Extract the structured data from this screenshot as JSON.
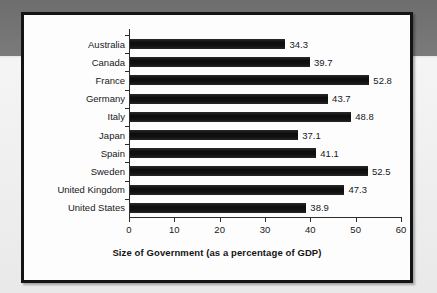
{
  "chart_data": {
    "type": "bar",
    "orientation": "horizontal",
    "title": "",
    "xlabel": "Size of Government (as a percentage of GDP)",
    "ylabel": "",
    "categories": [
      "Australia",
      "Canada",
      "France",
      "Germany",
      "Italy",
      "Japan",
      "Spain",
      "Sweden",
      "United Kingdom",
      "United States"
    ],
    "values": [
      34.3,
      39.7,
      52.8,
      43.7,
      48.8,
      37.1,
      41.1,
      52.5,
      47.3,
      38.9
    ],
    "value_labels": [
      "34.3",
      "39.7",
      "52.8",
      "43.7",
      "48.8",
      "37.1",
      "41.1",
      "52.5",
      "47.3",
      "38.9"
    ],
    "xlim": [
      0,
      60
    ],
    "xticks": [
      0,
      10,
      20,
      30,
      40,
      50,
      60
    ],
    "xtick_labels": [
      "0",
      "10",
      "20",
      "30",
      "40",
      "50",
      "60"
    ],
    "grid": false,
    "legend": null,
    "bar_color": "#121212",
    "axis_color": "#2c2c2c",
    "text_color": "#18181a",
    "panel_background": "#fdfdfd",
    "page_background": "#f2f2f2",
    "band_color": "#747474"
  }
}
